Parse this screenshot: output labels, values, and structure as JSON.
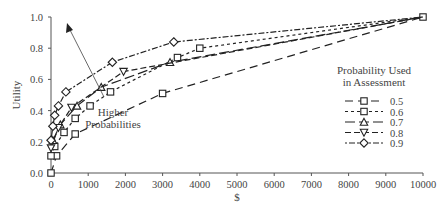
{
  "chart_data": {
    "type": "line",
    "title": "",
    "xlabel": "$",
    "ylabel": "Utility",
    "xlim": [
      0,
      10000
    ],
    "ylim": [
      0.0,
      1.0
    ],
    "x_ticks": [
      0,
      1000,
      2000,
      3000,
      4000,
      5000,
      6000,
      7000,
      8000,
      9000,
      10000
    ],
    "y_ticks": [
      "0.0",
      "0.2",
      "0.4",
      "0.6",
      "0.8",
      "1.0"
    ],
    "grid": false,
    "legend": {
      "title_line1": "Probability Used",
      "title_line2": "in Assessment",
      "position": "right"
    },
    "annotation": {
      "line1": "Higher",
      "line2": "Probabilities",
      "arrow": true
    },
    "series": [
      {
        "name": "0.5",
        "marker": "square",
        "dash": "8,5",
        "points": [
          [
            0,
            0.0
          ],
          [
            150,
            0.11
          ],
          [
            650,
            0.25
          ],
          [
            3000,
            0.51
          ],
          [
            10000,
            1.0
          ]
        ]
      },
      {
        "name": "0.6",
        "marker": "square",
        "dash": "3,3",
        "points": [
          [
            0,
            0.11
          ],
          [
            100,
            0.17
          ],
          [
            350,
            0.26
          ],
          [
            650,
            0.35
          ],
          [
            1050,
            0.43
          ],
          [
            1600,
            0.52
          ],
          [
            3400,
            0.74
          ],
          [
            4000,
            0.8
          ],
          [
            10000,
            1.0
          ]
        ]
      },
      {
        "name": "0.7",
        "marker": "triangle",
        "dash": "10,4",
        "points": [
          [
            50,
            0.21
          ],
          [
            250,
            0.31
          ],
          [
            700,
            0.43
          ],
          [
            1350,
            0.55
          ],
          [
            3200,
            0.71
          ],
          [
            10000,
            1.0
          ]
        ]
      },
      {
        "name": "0.8",
        "marker": "triangle-down",
        "dash": "6,3",
        "points": [
          [
            0,
            0.16
          ],
          [
            200,
            0.29
          ],
          [
            550,
            0.42
          ],
          [
            1950,
            0.65
          ],
          [
            10000,
            1.0
          ]
        ]
      },
      {
        "name": "0.9",
        "marker": "diamond",
        "dash": "2,2,6,2",
        "points": [
          [
            0,
            0.21
          ],
          [
            50,
            0.3
          ],
          [
            100,
            0.37
          ],
          [
            200,
            0.43
          ],
          [
            400,
            0.52
          ],
          [
            1650,
            0.71
          ],
          [
            3300,
            0.84
          ],
          [
            10000,
            1.0
          ]
        ]
      }
    ]
  }
}
